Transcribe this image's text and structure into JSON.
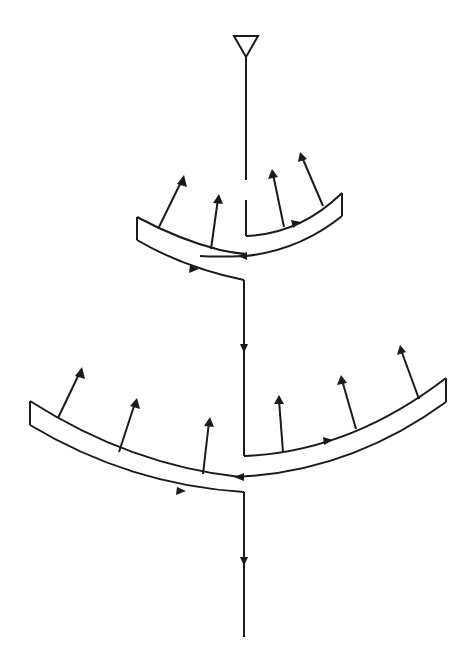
{
  "diagram": {
    "type": "flow-schematic",
    "colors": {
      "stroke": "#1a1a1a",
      "background": "#ffffff"
    },
    "input_marker": {
      "shape": "inverted-triangle",
      "x": 246,
      "y": 36
    },
    "upper_band": {
      "left_end": {
        "x": 137,
        "top": 217,
        "bottom": 240
      },
      "right_end": {
        "x": 342,
        "top": 193,
        "bottom": 216
      },
      "radiating_arrows": 4
    },
    "lower_band": {
      "left_end": {
        "x": 30,
        "top": 401,
        "bottom": 425
      },
      "right_end": {
        "x": 446,
        "top": 378,
        "bottom": 402
      },
      "radiating_arrows": 6
    },
    "flow_arrows": 7,
    "output_line_end_y": 637
  }
}
